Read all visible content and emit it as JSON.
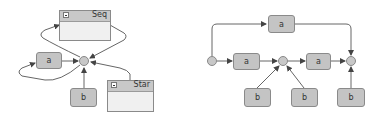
{
  "left_diagram": {
    "containers": [
      {
        "id": "seq",
        "title": "Seq",
        "collapse_icon": "minus-icon"
      },
      {
        "id": "star",
        "title": "Star",
        "collapse_icon": "minus-icon"
      }
    ],
    "nodes": [
      {
        "id": "a",
        "label": "a"
      },
      {
        "id": "b",
        "label": "b"
      }
    ],
    "junctions": 1
  },
  "right_diagram": {
    "nodes": [
      {
        "id": "a_top",
        "label": "a"
      },
      {
        "id": "a_1",
        "label": "a"
      },
      {
        "id": "a_2",
        "label": "a"
      },
      {
        "id": "b_1",
        "label": "b"
      },
      {
        "id": "b_2",
        "label": "b"
      },
      {
        "id": "b_3",
        "label": "b"
      }
    ],
    "junctions": 3
  },
  "colors": {
    "node_fill": "#c4c4c4",
    "node_border": "#8a8a8a",
    "edge": "#555555",
    "container_fill": "#f0f0f0"
  }
}
